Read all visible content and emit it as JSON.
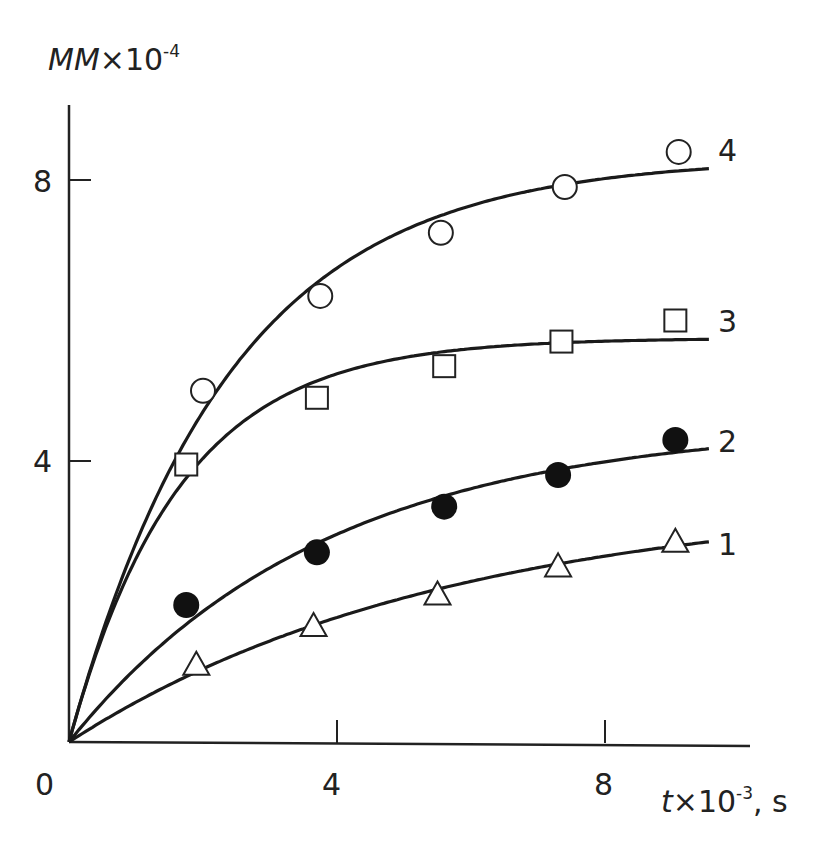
{
  "chart_data": {
    "type": "line",
    "title": "",
    "xlabel": "t×10⁻³, s",
    "ylabel": "MM×10⁻⁴",
    "xlim": [
      0,
      9.6
    ],
    "ylim": [
      0,
      9
    ],
    "x_ticks": [
      "0",
      "4",
      "8"
    ],
    "y_ticks": [
      "4",
      "8"
    ],
    "grid": false,
    "legend": "curve labels at right end",
    "series": [
      {
        "name": "1",
        "marker": "open-triangle",
        "x": [
          1.9,
          3.65,
          5.5,
          7.3,
          9.05
        ],
        "y": [
          1.1,
          1.65,
          2.1,
          2.5,
          2.85
        ]
      },
      {
        "name": "2",
        "marker": "filled-circle",
        "x": [
          1.75,
          3.7,
          5.6,
          7.3,
          9.05
        ],
        "y": [
          1.95,
          2.7,
          3.35,
          3.8,
          4.3
        ]
      },
      {
        "name": "3",
        "marker": "open-square",
        "x": [
          1.75,
          3.7,
          5.6,
          7.35,
          9.05
        ],
        "y": [
          3.95,
          4.9,
          5.35,
          5.7,
          6.0
        ]
      },
      {
        "name": "4",
        "marker": "open-circle",
        "x": [
          2.0,
          3.75,
          5.55,
          7.4,
          9.1
        ],
        "y": [
          5.0,
          6.35,
          7.25,
          7.9,
          8.4
        ]
      }
    ]
  },
  "axes": {
    "origin_label": "0",
    "x_tick_labels": [
      "4",
      "8"
    ],
    "y_tick_labels": [
      "4",
      "8"
    ],
    "y_title_main": "MM",
    "y_title_mult": "×10",
    "y_title_exp": "-4",
    "x_title_main": "t",
    "x_title_mult": "×10",
    "x_title_exp": "-3",
    "x_title_unit": ", s"
  },
  "curve_labels": [
    "1",
    "2",
    "3",
    "4"
  ]
}
